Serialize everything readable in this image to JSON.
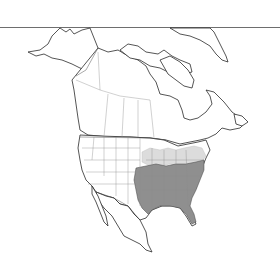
{
  "map": {
    "type": "range-map",
    "region": "North America",
    "colors": {
      "background": "#ffffff",
      "land": "#ffffff",
      "outline": "#2a2a2a",
      "range_core": "#8f8f8f",
      "range_peripheral": "#dcdcdc",
      "rule": "#6e6e6e"
    },
    "legend": {
      "range_core": "Southeastern United States (dark shading)",
      "range_peripheral": "Great Lakes / northern Midwest (light shading)"
    }
  }
}
